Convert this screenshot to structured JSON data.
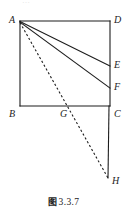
{
  "figure": {
    "caption_tag": "图",
    "caption_number": "3.3.7",
    "caption_full": "图 3.3.7",
    "top_cut_text": "…",
    "ink_color": "#1d1d1d",
    "background_color": "#ffffff",
    "vertices": [
      {
        "id": "A",
        "label": "A",
        "x": 20,
        "y": 21,
        "label_x": 9,
        "label_y": 15
      },
      {
        "id": "D",
        "label": "D",
        "x": 110,
        "y": 21,
        "label_x": 114,
        "label_y": 15
      },
      {
        "id": "E",
        "label": "E",
        "x": 110,
        "y": 66,
        "label_x": 114,
        "label_y": 60
      },
      {
        "id": "F",
        "label": "F",
        "x": 110,
        "y": 88,
        "label_x": 114,
        "label_y": 82
      },
      {
        "id": "B",
        "label": "B",
        "x": 20,
        "y": 106,
        "label_x": 9,
        "label_y": 109
      },
      {
        "id": "G",
        "label": "G",
        "x": 66,
        "y": 106,
        "label_x": 60,
        "label_y": 109
      },
      {
        "id": "C",
        "label": "C",
        "x": 110,
        "y": 106,
        "label_x": 114,
        "label_y": 109
      },
      {
        "id": "H",
        "label": "H",
        "x": 108,
        "y": 178,
        "label_x": 112,
        "label_y": 176
      }
    ],
    "segments": [
      {
        "name": "side-AD",
        "from": "A",
        "to": "D",
        "style": "solid"
      },
      {
        "name": "side-AB",
        "from": "A",
        "to": "B",
        "style": "solid"
      },
      {
        "name": "side-BC",
        "from": "B",
        "to": "C",
        "style": "solid"
      },
      {
        "name": "side-DC",
        "from": "D",
        "to": "C",
        "style": "solid"
      },
      {
        "name": "segment-AE",
        "from": "A",
        "to": "E",
        "style": "solid"
      },
      {
        "name": "segment-AF",
        "from": "A",
        "to": "F",
        "style": "solid"
      },
      {
        "name": "segment-CH",
        "from": "C",
        "to": "H",
        "style": "solid"
      },
      {
        "name": "segment-AH",
        "from": "A",
        "to": "H",
        "style": "dashed"
      }
    ],
    "dash_pattern": "2.2 2.2",
    "stroke_width": 1.1
  }
}
